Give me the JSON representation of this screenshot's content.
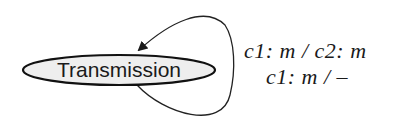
{
  "diagram": {
    "type": "state-machine",
    "nodes": [
      {
        "id": "transmission",
        "label": "Transmission",
        "shape": "ellipse",
        "fill": "#eeeeee",
        "stroke": "#111111"
      }
    ],
    "edges": [
      {
        "from": "transmission",
        "to": "transmission",
        "type": "self-loop",
        "labels": [
          "c1: m / c2: m",
          "c1: m / –"
        ]
      }
    ]
  }
}
